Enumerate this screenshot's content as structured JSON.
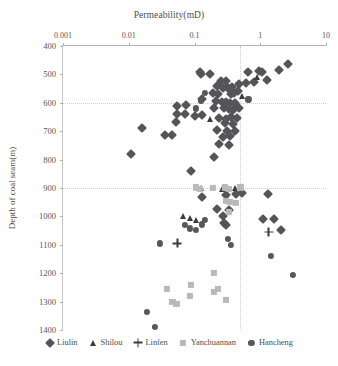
{
  "chart_data": {
    "type": "scatter",
    "title": "",
    "xlabel": "Permeability(mD)",
    "ylabel": "Depth of coal seam(m)",
    "xscale": "log",
    "xlim": [
      0.001,
      10
    ],
    "ylim": [
      400,
      1400
    ],
    "y_inverted": true,
    "xticks": [
      0.001,
      0.01,
      0.1,
      1,
      10
    ],
    "xtick_labels": [
      "0.001",
      "0.01",
      "0.1",
      "1",
      "10"
    ],
    "yticks": [
      400,
      500,
      600,
      700,
      800,
      900,
      1000,
      1100,
      1200,
      1300,
      1400
    ],
    "ytick_labels": [
      "400",
      "500",
      "600",
      "700",
      "800",
      "900",
      "1000",
      "1100",
      "1200",
      "1300",
      "1400"
    ],
    "grid": {
      "horizontal_at": [
        600,
        900
      ],
      "vertical_at": [
        0.5
      ],
      "style": "dotted"
    },
    "legend_position": "bottom",
    "series": [
      {
        "name": "Liulin",
        "marker": "diamond",
        "color": "#555559",
        "points": [
          [
            0.12,
            490
          ],
          [
            0.125,
            500
          ],
          [
            0.17,
            498
          ],
          [
            0.25,
            523
          ],
          [
            0.3,
            523
          ],
          [
            0.22,
            542
          ],
          [
            0.27,
            548
          ],
          [
            0.31,
            545
          ],
          [
            0.33,
            553
          ],
          [
            0.37,
            545
          ],
          [
            0.19,
            565
          ],
          [
            0.23,
            568
          ],
          [
            0.36,
            570
          ],
          [
            0.4,
            566
          ],
          [
            0.46,
            560
          ],
          [
            0.13,
            585
          ],
          [
            0.21,
            592
          ],
          [
            0.26,
            596
          ],
          [
            0.3,
            597
          ],
          [
            0.35,
            600
          ],
          [
            0.42,
            600
          ],
          [
            0.055,
            612
          ],
          [
            0.075,
            608
          ],
          [
            0.2,
            618
          ],
          [
            0.28,
            620
          ],
          [
            0.33,
            622
          ],
          [
            0.39,
            625
          ],
          [
            0.47,
            618
          ],
          [
            0.055,
            640
          ],
          [
            0.072,
            638
          ],
          [
            0.1,
            645
          ],
          [
            0.13,
            643
          ],
          [
            0.24,
            655
          ],
          [
            0.3,
            658
          ],
          [
            0.36,
            650
          ],
          [
            0.44,
            655
          ],
          [
            0.052,
            668
          ],
          [
            0.29,
            672
          ],
          [
            0.38,
            676
          ],
          [
            0.016,
            690
          ],
          [
            0.22,
            695
          ],
          [
            0.31,
            700
          ],
          [
            0.41,
            698
          ],
          [
            0.036,
            712
          ],
          [
            0.046,
            715
          ],
          [
            0.27,
            720
          ],
          [
            0.35,
            718
          ],
          [
            0.24,
            745
          ],
          [
            0.33,
            748
          ],
          [
            0.011,
            782
          ],
          [
            0.2,
            790
          ],
          [
            0.09,
            840
          ],
          [
            0.13,
            930
          ],
          [
            0.3,
            925
          ],
          [
            0.43,
            920
          ],
          [
            0.52,
            918
          ],
          [
            1.3,
            922
          ],
          [
            0.22,
            975
          ],
          [
            0.33,
            978
          ],
          [
            0.27,
            1000
          ],
          [
            0.28,
            1022
          ],
          [
            0.3,
            1030
          ],
          [
            1.1,
            1008
          ],
          [
            1.6,
            1010
          ],
          [
            2.1,
            1048
          ],
          [
            0.66,
            490
          ],
          [
            0.95,
            487
          ],
          [
            1.05,
            492
          ],
          [
            1.9,
            485
          ],
          [
            1.25,
            520
          ],
          [
            0.8,
            525
          ],
          [
            2.6,
            462
          ],
          [
            0.48,
            535
          ],
          [
            0.6,
            532
          ]
        ]
      },
      {
        "name": "Shilou",
        "marker": "triangle",
        "color": "#3b3b3f",
        "points": [
          [
            0.17,
            658
          ],
          [
            0.52,
            575
          ],
          [
            0.88,
            510
          ],
          [
            0.125,
            900
          ],
          [
            0.26,
            903
          ],
          [
            0.41,
            900
          ],
          [
            0.066,
            1000
          ],
          [
            0.086,
            1005
          ],
          [
            0.105,
            1012
          ]
        ]
      },
      {
        "name": "Linfen",
        "marker": "plus",
        "color": "#3b3b3f",
        "points": [
          [
            0.055,
            1095
          ],
          [
            1.35,
            1055
          ]
        ]
      },
      {
        "name": "Yanchuannan",
        "marker": "square",
        "color": "#b9b9b9",
        "points": [
          [
            0.105,
            898
          ],
          [
            0.12,
            902
          ],
          [
            0.19,
            900
          ],
          [
            0.29,
            898
          ],
          [
            0.33,
            902
          ],
          [
            0.5,
            898
          ],
          [
            0.3,
            945
          ],
          [
            0.35,
            948
          ],
          [
            0.43,
            952
          ],
          [
            0.33,
            985
          ],
          [
            0.046,
            1300
          ],
          [
            0.053,
            1308
          ],
          [
            0.038,
            1255
          ],
          [
            0.088,
            1240
          ],
          [
            0.085,
            1280
          ],
          [
            0.2,
            1200
          ],
          [
            0.23,
            1255
          ],
          [
            0.2,
            1265
          ],
          [
            0.3,
            1295
          ]
        ]
      },
      {
        "name": "Hancheng",
        "marker": "circle",
        "color": "#58585c",
        "points": [
          [
            0.145,
            565
          ],
          [
            0.125,
            592
          ],
          [
            0.66,
            588
          ],
          [
            0.105,
            620
          ],
          [
            0.072,
            1030
          ],
          [
            0.085,
            1042
          ],
          [
            0.105,
            1048
          ],
          [
            0.128,
            1028
          ],
          [
            0.145,
            1012
          ],
          [
            0.03,
            1095
          ],
          [
            0.019,
            1335
          ],
          [
            0.025,
            1390
          ],
          [
            0.32,
            1080
          ],
          [
            0.36,
            1100
          ],
          [
            1.45,
            1140
          ],
          [
            3.1,
            1205
          ]
        ]
      }
    ]
  },
  "axes": {
    "x_title": "Permeability(mD)",
    "y_title": "Depth of coal seam(m)"
  },
  "legend": {
    "items": [
      {
        "label": "Liulin",
        "marker": "diamond-icon"
      },
      {
        "label": "Shilou",
        "marker": "triangle-icon"
      },
      {
        "label": "Linfen",
        "marker": "plus-icon"
      },
      {
        "label": "Yanchuannan",
        "marker": "square-icon"
      },
      {
        "label": "Hancheng",
        "marker": "circle-icon"
      }
    ]
  }
}
